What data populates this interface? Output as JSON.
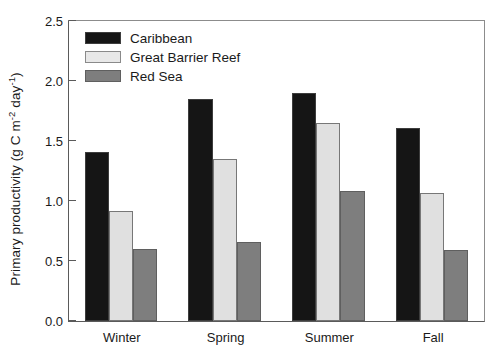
{
  "chart_data": {
    "type": "bar",
    "title": "",
    "subtitle": "",
    "xlabel": "",
    "ylabel": "Primary productivity (g C m-2 day-1)",
    "ylabel_parts": {
      "prefix": "Primary productivity (g C m",
      "sup1": "-2",
      "mid": " day",
      "sup2": "-1",
      "suffix": ")"
    },
    "categories": [
      "Winter",
      "Spring",
      "Summer",
      "Fall"
    ],
    "series": [
      {
        "name": "Caribbean",
        "color": "#151515",
        "values": [
          1.41,
          1.85,
          1.9,
          1.61
        ]
      },
      {
        "name": "Great Barrier Reef",
        "color": "#e0e0e0",
        "values": [
          0.92,
          1.35,
          1.65,
          1.07
        ]
      },
      {
        "name": "Red Sea",
        "color": "#7e7e7e",
        "values": [
          0.6,
          0.66,
          1.08,
          0.59
        ]
      }
    ],
    "ylim": [
      0.0,
      2.5
    ],
    "yticks": [
      0.0,
      0.5,
      1.0,
      1.5,
      2.0,
      2.5
    ],
    "ytick_labels": [
      "0.0",
      "0.5",
      "1.0",
      "1.5",
      "2.0",
      "2.5"
    ],
    "grid": false,
    "legend_position": "top-left",
    "bar_gap_ratio": 0.0,
    "group_pad_ratio": 0.3
  }
}
